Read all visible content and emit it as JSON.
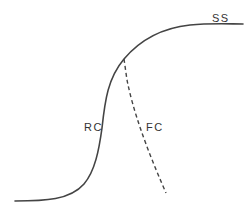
{
  "diagram": {
    "type": "curve-diagram",
    "colors": {
      "background": "#ffffff",
      "line": "#444444",
      "text": "#333333"
    },
    "curves": [
      {
        "id": "sigmoid",
        "style": "solid",
        "description": "S-shaped curve rising from lower-left to plateau at upper-right"
      },
      {
        "id": "branch",
        "style": "dashed",
        "description": "Dashed line branching downward-right from the upper bend of the S-curve"
      }
    ],
    "labels": {
      "ss": "SS",
      "rc": "RC",
      "fc": "FC"
    }
  }
}
